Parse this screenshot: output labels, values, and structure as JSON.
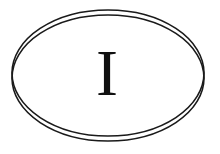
{
  "sticker": {
    "type": "oval country code sticker",
    "letter": "I",
    "stroke_color": "#1a1a1a",
    "background": "#ffffff"
  }
}
